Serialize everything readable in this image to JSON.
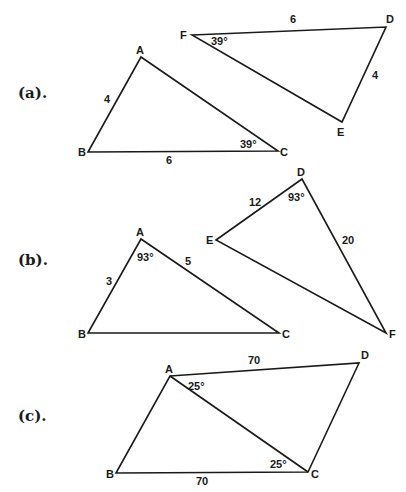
{
  "parts": [
    {
      "label": "(a).",
      "figures": [
        {
          "name": "triangle-ABC",
          "vertices": {
            "A": "A",
            "B": "B",
            "C": "C"
          },
          "side_labels": {
            "AB": "4",
            "BC": "6"
          },
          "angle_labels": {
            "C": "39°"
          }
        },
        {
          "name": "triangle-DEF",
          "vertices": {
            "D": "D",
            "E": "E",
            "F": "F"
          },
          "side_labels": {
            "FD": "6",
            "DE": "4"
          },
          "angle_labels": {
            "F": "39°"
          }
        }
      ]
    },
    {
      "label": "(b).",
      "figures": [
        {
          "name": "triangle-ABC",
          "vertices": {
            "A": "A",
            "B": "B",
            "C": "C"
          },
          "side_labels": {
            "AB": "3",
            "AC": "5"
          },
          "angle_labels": {
            "A": "93°"
          }
        },
        {
          "name": "triangle-DEF",
          "vertices": {
            "D": "D",
            "E": "E",
            "F": "F"
          },
          "side_labels": {
            "DE": "12",
            "DF": "20"
          },
          "angle_labels": {
            "D": "93°"
          }
        }
      ]
    },
    {
      "label": "(c).",
      "figures": [
        {
          "name": "quadrilateral-ABCD-with-diagonal-AC",
          "vertices": {
            "A": "A",
            "B": "B",
            "C": "C",
            "D": "D"
          },
          "side_labels": {
            "AD": "70",
            "BC": "70"
          },
          "angle_labels": {
            "DAC": "25°",
            "ACB": "25°"
          }
        }
      ]
    }
  ]
}
